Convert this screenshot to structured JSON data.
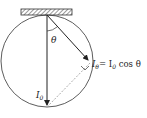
{
  "diagram": {
    "angle_label": "θ",
    "vertical_label": "I",
    "vertical_sub": "0",
    "projection_label": "I",
    "projection_sub": "θ",
    "equation_rhs": "= I",
    "equation_rhs_sub": "0",
    "equation_tail": " cos θ",
    "colors": {
      "stroke": "#333333",
      "hatch": "#555555",
      "dashed": "#888888"
    }
  }
}
